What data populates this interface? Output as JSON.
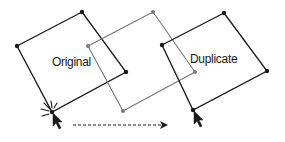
{
  "diagram": {
    "colors": {
      "primary_stroke": "#1a1a1a",
      "ghost_stroke": "#777777",
      "background": "#ffffff"
    },
    "shapes": [
      {
        "id": "original",
        "label": "Original",
        "style": "solid-dark",
        "vertices": [
          [
            82,
            12
          ],
          [
            126,
            72
          ],
          [
            52,
            112
          ],
          [
            17,
            46
          ]
        ],
        "label_position": [
          52,
          66
        ]
      },
      {
        "id": "ghost",
        "label": "",
        "style": "solid-gray",
        "vertices": [
          [
            153,
            12
          ],
          [
            195,
            72
          ],
          [
            123,
            111
          ],
          [
            88,
            46
          ]
        ]
      },
      {
        "id": "duplicate",
        "label": "Duplicate",
        "style": "solid-dark",
        "vertices": [
          [
            224,
            13
          ],
          [
            267,
            71
          ],
          [
            193,
            110
          ],
          [
            162,
            45
          ]
        ],
        "label_position": [
          190,
          63
        ]
      }
    ],
    "drag_arrow": {
      "style": "dashed",
      "from": [
        73,
        125
      ],
      "to": [
        168,
        125
      ]
    },
    "cursors": [
      {
        "id": "start-cursor",
        "position": [
          52,
          112
        ],
        "click_burst": true
      },
      {
        "id": "end-cursor",
        "position": [
          193,
          110
        ],
        "click_burst": false
      }
    ]
  }
}
